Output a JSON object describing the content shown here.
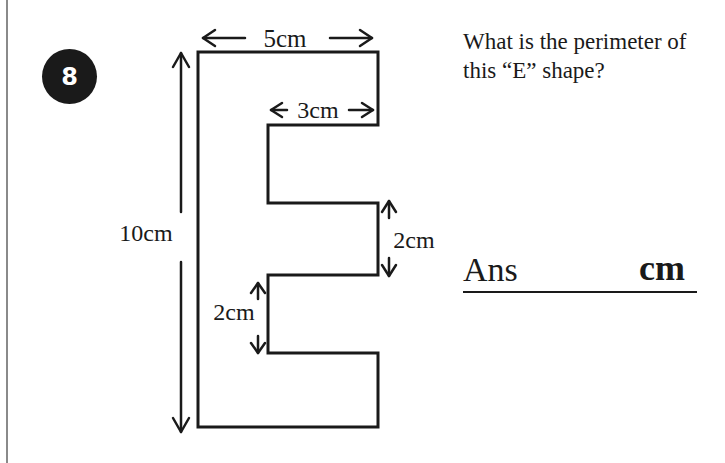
{
  "question": {
    "number": "8",
    "text": "What is the perimeter of this “E” shape?"
  },
  "answer": {
    "label": "Ans",
    "unit": "cm"
  },
  "figure": {
    "shape": "E",
    "labels": {
      "top_width": "5cm",
      "arm_width": "3cm",
      "height": "10cm",
      "middle_arm_gap": "2cm",
      "lower_notch_gap": "2cm"
    }
  },
  "colors": {
    "ink": "#1a1a1a",
    "badge_bg": "#1a1a1a",
    "badge_text": "#ffffff",
    "margin_rule": "#8a8a8a"
  }
}
